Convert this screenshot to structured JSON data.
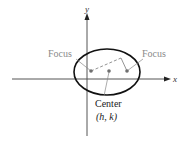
{
  "diagram": {
    "axes": {
      "x_label": "x",
      "y_label": "y"
    },
    "labels": {
      "focus_left": "Focus",
      "focus_right": "Focus",
      "center": "Center",
      "center_coords": "(h, k)"
    },
    "colors": {
      "axis": "#333333",
      "ellipse": "#111111",
      "focus_label": "#8a8a8a",
      "leader": "#8a8a8a",
      "dot": "#7a7a7a",
      "text": "#222222"
    }
  }
}
